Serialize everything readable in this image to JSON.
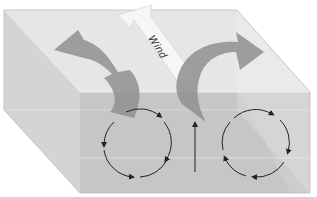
{
  "diagram": {
    "type": "3D block diagram",
    "labels": {
      "wind": "Wind"
    },
    "colors": {
      "top_face": "#e4e4e4",
      "front_face": "#c8c8c8",
      "left_face": "#d2d2d2",
      "curved_arrows": "#8f8f8f",
      "wind_arrow": "#f4f4f4",
      "circulation_lines": "#222222"
    },
    "elements": {
      "left_surface_arrow": "curves from center toward upper-left and dives down into the water",
      "right_surface_arrow": "rises from center and curves toward upper-right",
      "left_cell": "circulation circle with arrowheads",
      "right_cell": "circulation circle with arrowheads",
      "center_arrow": "vertical upward arrow between the two cells"
    }
  }
}
